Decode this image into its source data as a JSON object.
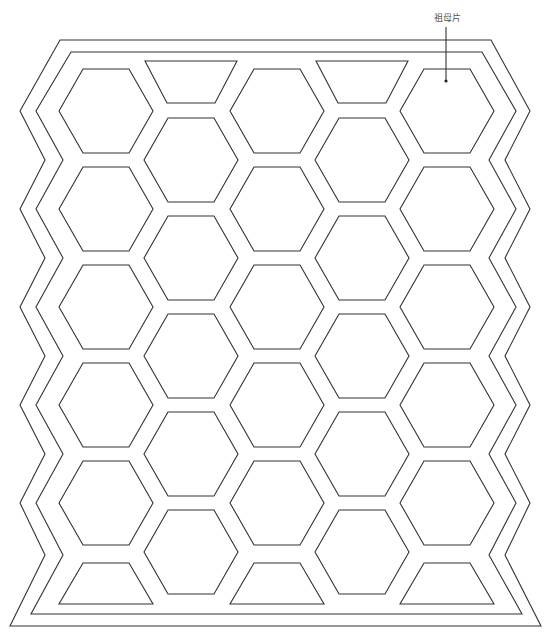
{
  "diagram": {
    "label": "祖母片",
    "label_position": {
      "x": 434,
      "y": 11
    },
    "leader_line": {
      "x": 446,
      "y1": 27,
      "y2": 81
    },
    "stroke_color": "#333333",
    "background": "#ffffff",
    "hexagon": {
      "half_width": 47,
      "half_height": 42,
      "top_half": 23
    },
    "columns_x": [
      106,
      191,
      277,
      362,
      447
    ],
    "odd_column_rows_y": [
      111,
      209,
      307,
      405,
      503
    ],
    "even_column_rows_y": [
      160,
      258,
      356,
      454,
      552
    ],
    "top_trapezoids": [
      {
        "cx": 191,
        "top_y": 61,
        "bottom_y": 103
      },
      {
        "cx": 362,
        "top_y": 61,
        "bottom_y": 103
      }
    ],
    "bottom_trapezoids": [
      {
        "cx": 106,
        "top_y": 563,
        "bottom_y": 604
      },
      {
        "cx": 277,
        "top_y": 563,
        "bottom_y": 604
      },
      {
        "cx": 447,
        "top_y": 563,
        "bottom_y": 604
      }
    ],
    "hexagon_count": 25,
    "trapezoid_count": 5
  }
}
